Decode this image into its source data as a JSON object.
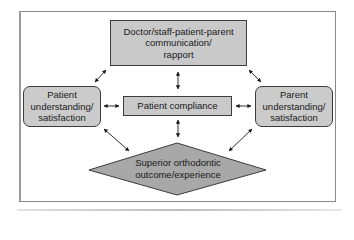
{
  "diagram": {
    "nodes": {
      "top": {
        "label": "Doctor/staff-patient-parent communication/ rapport",
        "lines": [
          "Doctor/staff-patient-parent",
          "communication/",
          "rapport"
        ],
        "shape": "rectangle"
      },
      "left": {
        "lines": [
          "Patient",
          "understanding/",
          "satisfaction"
        ],
        "shape": "rounded-rectangle"
      },
      "center": {
        "lines": [
          "Patient compliance"
        ],
        "shape": "rectangle"
      },
      "right": {
        "lines": [
          "Parent",
          "understanding/",
          "satisfaction"
        ],
        "shape": "rounded-rectangle"
      },
      "bottom": {
        "lines": [
          "Superior orthodontic",
          "outcome/experience"
        ],
        "shape": "diamond"
      }
    },
    "edges": [
      {
        "from": "top",
        "to": "left",
        "type": "bidirectional"
      },
      {
        "from": "top",
        "to": "right",
        "type": "bidirectional"
      },
      {
        "from": "top",
        "to": "center",
        "type": "bidirectional"
      },
      {
        "from": "left",
        "to": "center",
        "type": "bidirectional"
      },
      {
        "from": "center",
        "to": "right",
        "type": "bidirectional"
      },
      {
        "from": "center",
        "to": "bottom",
        "type": "bidirectional"
      },
      {
        "from": "left",
        "to": "bottom",
        "type": "bidirectional"
      },
      {
        "from": "right",
        "to": "bottom",
        "type": "bidirectional"
      }
    ],
    "colors": {
      "box_fill": "#c9c9c9",
      "diamond_fill": "#a8a8a8",
      "stroke": "#3c3c3c"
    }
  }
}
